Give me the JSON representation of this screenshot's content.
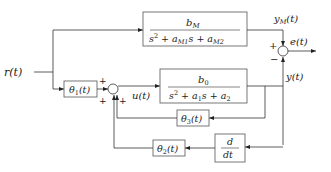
{
  "diagram": {
    "type": "block-diagram",
    "signals": {
      "reference": "r(t)",
      "model_output": "y_M(t)",
      "error": "e(t)",
      "control": "u(t)",
      "plant_output": "y(t)"
    },
    "blocks": {
      "reference_model": {
        "numerator": "b",
        "numerator_sub": "M",
        "denominator": "s² + a",
        "denominator_parts": [
          "s",
          "2",
          " + a",
          "M1",
          "s + a",
          "M2"
        ]
      },
      "plant": {
        "numerator": "b",
        "numerator_sub": "0",
        "denominator_parts": [
          "s",
          "2",
          " + a",
          "1",
          "s + a",
          "2"
        ]
      },
      "theta1": {
        "label": "θ",
        "sub": "1",
        "arg": "(t)"
      },
      "theta2": {
        "label": "θ",
        "sub": "2",
        "arg": "(t)"
      },
      "theta3": {
        "label": "θ",
        "sub": "3",
        "arg": "(t)"
      },
      "derivative": {
        "numerator": "d",
        "denominator": "dt"
      }
    },
    "summing_junctions": {
      "input_sum": {
        "signs": [
          "+",
          "+",
          "+"
        ]
      },
      "error_sum": {
        "signs": [
          "+",
          "−"
        ]
      }
    },
    "labels": {
      "r": "r(t)",
      "yM": "y",
      "yM_sub": "M",
      "yM_arg": "(t)",
      "e": "e(t)",
      "u": "u(t)",
      "y": "y(t)",
      "plus": "+",
      "minus": "−"
    },
    "colors": {
      "line": "#333333",
      "box_border": "#555555",
      "background": "#ffffff"
    }
  }
}
